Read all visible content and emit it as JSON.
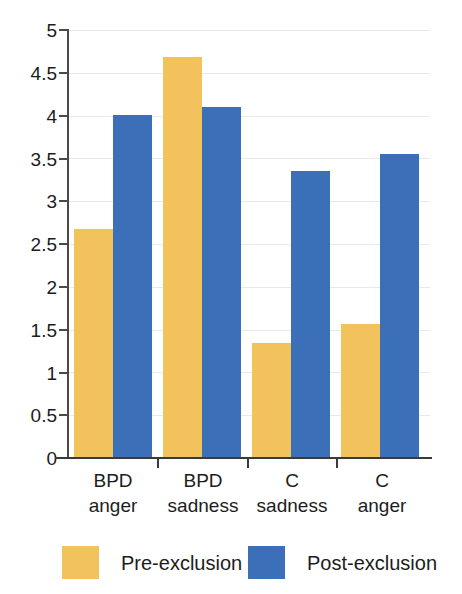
{
  "chart_data": {
    "type": "bar",
    "title": "",
    "subtitle": "",
    "xlabel": "",
    "ylabel": "",
    "categories": [
      "BPD anger",
      "BPD sadness",
      "C sadness",
      "C anger"
    ],
    "category_lines": [
      [
        "BPD",
        "anger"
      ],
      [
        "BPD",
        "sadness"
      ],
      [
        "C",
        "sadness"
      ],
      [
        "C",
        "anger"
      ]
    ],
    "series": [
      {
        "name": "Pre-exclusion",
        "color": "#f2c35c",
        "values": [
          2.67,
          4.68,
          1.34,
          1.57
        ]
      },
      {
        "name": "Post-exclusion",
        "color": "#3b70b9",
        "values": [
          4.01,
          4.1,
          3.35,
          3.55
        ]
      }
    ],
    "ylim": [
      0,
      5
    ],
    "ytick_values": [
      0,
      0.5,
      1,
      1.5,
      2,
      2.5,
      3,
      3.5,
      4,
      4.5,
      5
    ],
    "ytick_labels": [
      "0",
      "0.5",
      "1",
      "1.5",
      "2",
      "2.5",
      "3",
      "3.5",
      "4",
      "4.5",
      "5"
    ],
    "grid": true,
    "grid_axis": "y",
    "legend_position": "bottom",
    "bar_group_gap": true
  },
  "legend": {
    "items": [
      {
        "label": "Pre-exclusion",
        "color": "#f2c35c"
      },
      {
        "label": "Post-exclusion",
        "color": "#3b70b9"
      }
    ]
  },
  "colors": {
    "pre_exclusion": "#f2c35c",
    "post_exclusion": "#3b70b9",
    "axis": "#3a3a3a",
    "gridline": "#e9e9ea",
    "background": "#ffffff",
    "text": "#1c1c1c"
  }
}
